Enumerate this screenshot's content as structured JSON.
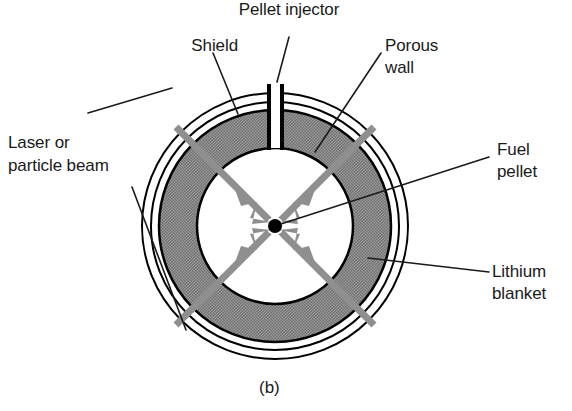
{
  "figure": {
    "caption": "(b)",
    "labels": {
      "shield": "Shield",
      "pellet_injector": "Pellet injector",
      "porous_wall_line1": "Porous",
      "porous_wall_line2": "wall",
      "laser_beam_line1": "Laser or",
      "laser_beam_line2": "particle beam",
      "fuel_pellet_line1": "Fuel",
      "fuel_pellet_line2": "pellet",
      "lithium_blanket_line1": "Lithium",
      "lithium_blanket_line2": "blanket"
    },
    "icons": {
      "beam_arrow": "beam-arrow-icon",
      "fuel_pellet_dot": "fuel-pellet-dot-icon",
      "injector_tube": "injector-tube-icon"
    },
    "colors": {
      "outline": "#000000",
      "blanket_fill": "#8c8c8c",
      "beam_gray": "#8f8f8f",
      "pellet_black": "#000000",
      "background": "#ffffff",
      "text": "#1a1a1a",
      "leader_line": "#1a1a1a"
    },
    "geometry": {
      "center_x": 275,
      "center_y": 226,
      "shield_outer_radius": 133,
      "shield_inner_radius": 124,
      "blanket_outer_radius": 116,
      "blanket_inner_radius": 78,
      "pellet_radius": 7,
      "injector_tube_half_width": 7,
      "injector_tube_top_y": 84,
      "beam_outer_radius": 140,
      "beam_stroke_width": 7
    },
    "beams": [
      {
        "name": "beam-upper-left",
        "angle_deg": 225
      },
      {
        "name": "beam-upper-right",
        "angle_deg": 315
      },
      {
        "name": "beam-lower-left",
        "angle_deg": 135
      },
      {
        "name": "beam-lower-right",
        "angle_deg": 45
      }
    ]
  }
}
